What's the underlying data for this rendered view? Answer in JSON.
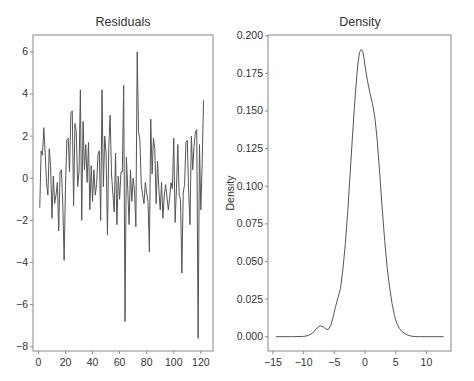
{
  "figure": {
    "background": "#ffffff",
    "line_color": "#555555",
    "axis_color": "#888888",
    "text_color": "#333333"
  },
  "chart_data": [
    {
      "type": "line",
      "title": "Residuals",
      "xlabel": "",
      "ylabel": "",
      "xlim": [
        -4,
        129
      ],
      "ylim": [
        -8.2,
        6.8
      ],
      "xticks": [
        0,
        20,
        40,
        60,
        80,
        100,
        120
      ],
      "xtick_labels": [
        "0",
        "20",
        "40",
        "60",
        "80",
        "100",
        "120"
      ],
      "yticks": [
        -8,
        -6,
        -4,
        -2,
        0,
        2,
        4,
        6
      ],
      "ytick_labels": [
        "−8",
        "−6",
        "−4",
        "−2",
        "0",
        "2",
        "4",
        "6"
      ],
      "grid": false,
      "legend": null,
      "x": [
        1,
        2,
        3,
        4,
        5,
        6,
        7,
        8,
        9,
        10,
        11,
        12,
        13,
        14,
        15,
        16,
        17,
        18,
        19,
        20,
        21,
        22,
        23,
        24,
        25,
        26,
        27,
        28,
        29,
        30,
        31,
        32,
        33,
        34,
        35,
        36,
        37,
        38,
        39,
        40,
        41,
        42,
        43,
        44,
        45,
        46,
        47,
        48,
        49,
        50,
        51,
        52,
        53,
        54,
        55,
        56,
        57,
        58,
        59,
        60,
        61,
        62,
        63,
        64,
        65,
        66,
        67,
        68,
        69,
        70,
        71,
        72,
        73,
        74,
        75,
        76,
        77,
        78,
        79,
        80,
        81,
        82,
        83,
        84,
        85,
        86,
        87,
        88,
        89,
        90,
        91,
        92,
        93,
        94,
        95,
        96,
        97,
        98,
        99,
        100,
        101,
        102,
        103,
        104,
        105,
        106,
        107,
        108,
        109,
        110,
        111,
        112,
        113,
        114,
        115,
        116,
        117,
        118,
        119,
        120,
        121,
        122
      ],
      "values": [
        -1.4,
        1.3,
        1.1,
        2.4,
        1.2,
        -0.2,
        -0.8,
        1.4,
        0.6,
        -1.9,
        0.1,
        -1.2,
        -0.8,
        -0.2,
        -2.5,
        0.3,
        0.4,
        -1.2,
        -3.9,
        -0.4,
        1.8,
        1.9,
        0.3,
        3.1,
        3.2,
        -1.3,
        2.6,
        2.2,
        -0.4,
        0.3,
        4.2,
        -2.0,
        2.7,
        0.4,
        1.6,
        -0.2,
        1.7,
        -1.5,
        0.6,
        -1.1,
        0.4,
        -0.8,
        -0.3,
        1.1,
        1.3,
        -2.0,
        4.2,
        -0.4,
        2.0,
        1.2,
        -2.7,
        1.5,
        3.0,
        0.2,
        -0.7,
        -1.6,
        1.2,
        -2.2,
        0.1,
        -1.0,
        0.3,
        0.3,
        4.4,
        -6.8,
        1.0,
        -0.5,
        -2.2,
        0.4,
        -1.1,
        0.0,
        -0.6,
        -2.3,
        6.0,
        2.2,
        1.8,
        -0.3,
        -0.8,
        -1.2,
        -0.2,
        -0.7,
        -1.1,
        -3.5,
        2.8,
        0.2,
        1.9,
        1.4,
        -1.2,
        0.8,
        -0.5,
        -1.5,
        -0.2,
        -1.9,
        -0.8,
        -0.3,
        -0.9,
        -1.5,
        -0.9,
        -0.2,
        -0.5,
        1.9,
        -2.1,
        -0.5,
        1.6,
        -0.8,
        -1.0,
        -4.5,
        -0.7,
        -0.3,
        1.7,
        1.8,
        -0.6,
        -2.2,
        2.0,
        0.4,
        1.5,
        2.2,
        2.3,
        -7.6,
        1.6,
        -1.5,
        0.7,
        3.7
      ]
    },
    {
      "type": "line",
      "title": "Density",
      "xlabel": "",
      "ylabel": "Density",
      "xlim": [
        -15.8,
        14.0
      ],
      "ylim": [
        -0.0095,
        0.2005
      ],
      "xticks": [
        -15,
        -10,
        -5,
        0,
        5,
        10
      ],
      "xtick_labels": [
        "−15",
        "−10",
        "−5",
        "0",
        "5",
        "10"
      ],
      "yticks": [
        0.0,
        0.025,
        0.05,
        0.075,
        0.1,
        0.125,
        0.15,
        0.175,
        0.2
      ],
      "ytick_labels": [
        "0.000",
        "0.025",
        "0.050",
        "0.075",
        "0.100",
        "0.125",
        "0.150",
        "0.175",
        "0.200"
      ],
      "grid": false,
      "legend": null,
      "x": [
        -14.5,
        -12,
        -10,
        -9.2,
        -8.5,
        -8,
        -7.5,
        -7.2,
        -6.8,
        -6.4,
        -6,
        -5.6,
        -5.2,
        -4.8,
        -4.4,
        -4,
        -3.6,
        -3.2,
        -2.8,
        -2.4,
        -2,
        -1.6,
        -1.2,
        -0.9,
        -0.6,
        -0.4,
        -0.2,
        0,
        0.4,
        0.8,
        1.2,
        1.6,
        2,
        2.4,
        2.8,
        3.2,
        3.6,
        4,
        4.4,
        4.8,
        5.2,
        5.6,
        6,
        6.5,
        7,
        7.5,
        8,
        9,
        10,
        12,
        12.8
      ],
      "values": [
        0.0,
        0.0,
        0.0002,
        0.0008,
        0.0025,
        0.005,
        0.0068,
        0.0072,
        0.0066,
        0.0052,
        0.0047,
        0.0072,
        0.013,
        0.02,
        0.026,
        0.032,
        0.045,
        0.062,
        0.084,
        0.11,
        0.136,
        0.16,
        0.18,
        0.189,
        0.191,
        0.19,
        0.186,
        0.18,
        0.17,
        0.162,
        0.155,
        0.146,
        0.13,
        0.108,
        0.085,
        0.064,
        0.046,
        0.033,
        0.022,
        0.014,
        0.0085,
        0.0055,
        0.0035,
        0.002,
        0.001,
        0.0004,
        0.0001,
        0.0,
        0.0,
        0.0,
        0.0
      ]
    }
  ]
}
